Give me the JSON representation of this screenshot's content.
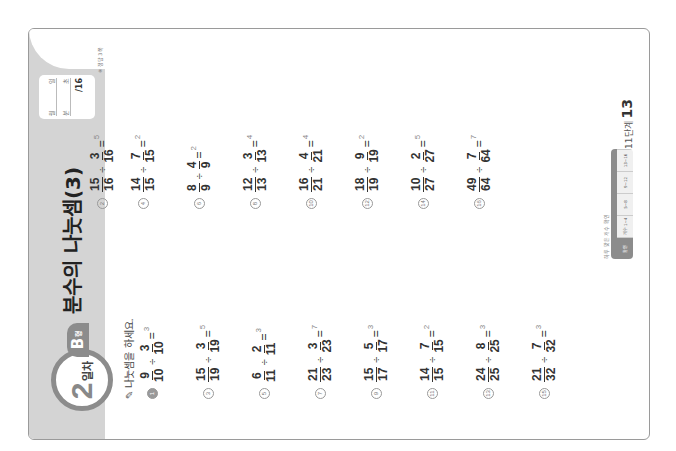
{
  "header": {
    "day_number": "2",
    "day_label": "일차",
    "type_letter": "B",
    "type_suffix": "형",
    "title": "분수의 나눗셈(3)"
  },
  "score_box": {
    "date_month": "월",
    "date_day": "일",
    "time_min": "분",
    "time_sec": "초",
    "score_total": "/16",
    "answer_ref": "※ 정답 3쪽"
  },
  "instruction": "나눗셈을 하세요.",
  "problems": [
    {
      "n": "1",
      "a_num": "9",
      "a_den": "10",
      "b_num": "3",
      "b_den": "10",
      "ans": "3"
    },
    {
      "n": "2",
      "a_num": "15",
      "a_den": "16",
      "b_num": "3",
      "b_den": "16",
      "ans": "5"
    },
    {
      "n": "3",
      "a_num": "15",
      "a_den": "19",
      "b_num": "3",
      "b_den": "19",
      "ans": "5"
    },
    {
      "n": "4",
      "a_num": "14",
      "a_den": "15",
      "b_num": "7",
      "b_den": "15",
      "ans": "2"
    },
    {
      "n": "5",
      "a_num": "6",
      "a_den": "11",
      "b_num": "2",
      "b_den": "11",
      "ans": "3"
    },
    {
      "n": "6",
      "a_num": "8",
      "a_den": "9",
      "b_num": "4",
      "b_den": "9",
      "ans": "2"
    },
    {
      "n": "7",
      "a_num": "21",
      "a_den": "23",
      "b_num": "3",
      "b_den": "23",
      "ans": "7"
    },
    {
      "n": "8",
      "a_num": "12",
      "a_den": "13",
      "b_num": "3",
      "b_den": "13",
      "ans": "4"
    },
    {
      "n": "9",
      "a_num": "15",
      "a_den": "17",
      "b_num": "5",
      "b_den": "17",
      "ans": "3"
    },
    {
      "n": "10",
      "a_num": "16",
      "a_den": "21",
      "b_num": "4",
      "b_den": "21",
      "ans": "4"
    },
    {
      "n": "11",
      "a_num": "14",
      "a_den": "15",
      "b_num": "7",
      "b_den": "15",
      "ans": "2"
    },
    {
      "n": "12",
      "a_num": "18",
      "a_den": "19",
      "b_num": "9",
      "b_den": "19",
      "ans": "2"
    },
    {
      "n": "13",
      "a_num": "24",
      "a_den": "25",
      "b_num": "8",
      "b_den": "25",
      "ans": "3"
    },
    {
      "n": "14",
      "a_num": "10",
      "a_den": "27",
      "b_num": "2",
      "b_den": "27",
      "ans": "5"
    },
    {
      "n": "15",
      "a_num": "21",
      "a_den": "32",
      "b_num": "7",
      "b_den": "32",
      "ans": "3"
    },
    {
      "n": "16",
      "a_num": "49",
      "a_den": "64",
      "b_num": "7",
      "b_den": "64",
      "ans": "7"
    }
  ],
  "symbols": {
    "divide": "÷",
    "equals": "="
  },
  "footer": {
    "table_label": "하루 맞은 개수 확인",
    "cells": [
      "확인",
      "개수 1~4",
      "5~8",
      "9~12",
      "13~16"
    ],
    "page_label": "11단계",
    "page_number": "13"
  },
  "colors": {
    "band": "#d4d4d4",
    "accent": "#8c8c8c",
    "text": "#333333"
  }
}
